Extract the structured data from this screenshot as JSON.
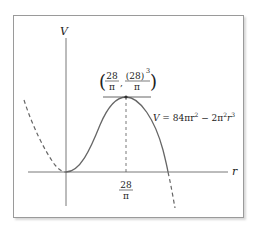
{
  "figure": {
    "axes": {
      "x_label": "r",
      "y_label": "V"
    },
    "peak_label": {
      "x_num": "28",
      "x_den": "π",
      "y_num": "(28)",
      "y_exp": "3",
      "y_den": "π",
      "comma": ","
    },
    "x_tick": {
      "num": "28",
      "den": "π"
    },
    "equation": {
      "lhs": "V",
      "eq": " = 84πr",
      "exp1": "2",
      "mid": " − 2π",
      "exp2": "2",
      "r": "r",
      "exp3": "3"
    },
    "colors": {
      "curve": "#666666",
      "axis": "#555555",
      "frame": "#9a9a9a"
    }
  }
}
